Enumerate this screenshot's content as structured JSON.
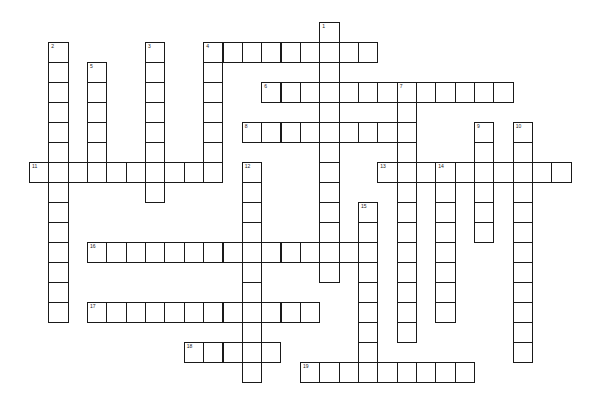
{
  "puzzle": {
    "type": "crossword",
    "grid": {
      "origin_x": 29,
      "origin_y": 22,
      "pitch_x": 19.35,
      "pitch_y": 20
    },
    "entries": [
      {
        "number": "1",
        "direction": "down",
        "col": 15,
        "row": 0,
        "length": 13
      },
      {
        "number": "2",
        "direction": "down",
        "col": 1,
        "row": 1,
        "length": 14
      },
      {
        "number": "3",
        "direction": "down",
        "col": 6,
        "row": 1,
        "length": 8
      },
      {
        "number": "4",
        "direction": "across",
        "col": 9,
        "row": 1,
        "length": 9
      },
      {
        "number": "4",
        "direction": "down",
        "col": 9,
        "row": 1,
        "length": 7
      },
      {
        "number": "5",
        "direction": "down",
        "col": 3,
        "row": 2,
        "length": 6
      },
      {
        "number": "6",
        "direction": "across",
        "col": 12,
        "row": 3,
        "length": 13
      },
      {
        "number": "7",
        "direction": "down",
        "col": 19,
        "row": 3,
        "length": 13
      },
      {
        "number": "8",
        "direction": "across",
        "col": 11,
        "row": 5,
        "length": 9
      },
      {
        "number": "9",
        "direction": "down",
        "col": 23,
        "row": 5,
        "length": 6
      },
      {
        "number": "10",
        "direction": "down",
        "col": 25,
        "row": 5,
        "length": 12
      },
      {
        "number": "11",
        "direction": "across",
        "col": 0,
        "row": 7,
        "length": 10
      },
      {
        "number": "12",
        "direction": "down",
        "col": 11,
        "row": 7,
        "length": 11
      },
      {
        "number": "13",
        "direction": "across",
        "col": 18,
        "row": 7,
        "length": 10
      },
      {
        "number": "14",
        "direction": "down",
        "col": 21,
        "row": 7,
        "length": 8
      },
      {
        "number": "15",
        "direction": "down",
        "col": 17,
        "row": 9,
        "length": 9
      },
      {
        "number": "16",
        "direction": "across",
        "col": 3,
        "row": 11,
        "length": 15
      },
      {
        "number": "17",
        "direction": "across",
        "col": 3,
        "row": 14,
        "length": 12
      },
      {
        "number": "18",
        "direction": "across",
        "col": 8,
        "row": 16,
        "length": 5
      },
      {
        "number": "19",
        "direction": "across",
        "col": 14,
        "row": 17,
        "length": 9
      }
    ]
  }
}
